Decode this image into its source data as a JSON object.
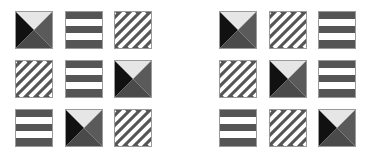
{
  "puzzle": {
    "colors": {
      "light": "#e6e6e6",
      "dark": "#111111",
      "mid": "#5a5a5a",
      "mid2": "#4a4a4a",
      "stripe": "#555555",
      "white": "#ffffff"
    },
    "grids": [
      {
        "name": "left",
        "tiles": [
          [
            "pyramid",
            "horizontal-stripes",
            "diagonal-stripes"
          ],
          [
            "diagonal-stripes",
            "horizontal-stripes",
            "pyramid"
          ],
          [
            "horizontal-stripes",
            "pyramid",
            "diagonal-stripes"
          ]
        ]
      },
      {
        "name": "right",
        "tiles": [
          [
            "pyramid",
            "diagonal-stripes",
            "horizontal-stripes"
          ],
          [
            "diagonal-stripes",
            "pyramid",
            "horizontal-stripes"
          ],
          [
            "horizontal-stripes",
            "diagonal-stripes",
            "pyramid"
          ]
        ]
      }
    ]
  }
}
